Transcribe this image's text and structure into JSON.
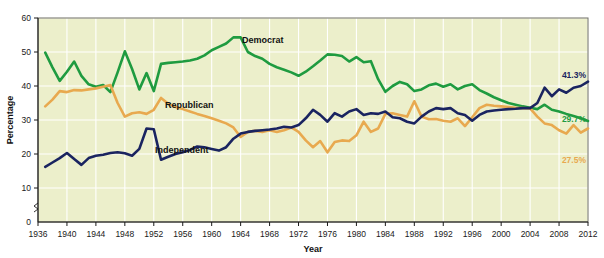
{
  "chart_data": {
    "type": "line",
    "title": "",
    "xlabel": "Year",
    "ylabel": "Percentage",
    "xlim": [
      1936,
      2012
    ],
    "ylim": [
      0,
      60
    ],
    "y_axis_break": true,
    "grid": true,
    "legend_position": "inline-labels",
    "background_color": "#ecefcb",
    "x_tick_labels": [
      "1936",
      "1940",
      "1944",
      "1948",
      "1952",
      "1956",
      "1960",
      "1964",
      "1968",
      "1972",
      "1976",
      "1980",
      "1984",
      "1988",
      "1992",
      "1996",
      "2000",
      "2004",
      "2008",
      "2012"
    ],
    "y_tick_labels": [
      "0",
      "10",
      "20",
      "30",
      "40",
      "50",
      "60"
    ],
    "y_ticks": [
      0,
      10,
      20,
      30,
      40,
      50,
      60
    ],
    "series": [
      {
        "name": "Democrat",
        "color": "#1f9b40",
        "inline_label": "Democrat",
        "end_label": "29.7%",
        "end_value": 29.7,
        "x": [
          1937,
          1938,
          1939,
          1940,
          1941,
          1942,
          1943,
          1944,
          1945,
          1946,
          1947,
          1948,
          1949,
          1950,
          1951,
          1952,
          1953,
          1954,
          1955,
          1956,
          1957,
          1958,
          1959,
          1960,
          1961,
          1962,
          1963,
          1964,
          1965,
          1966,
          1967,
          1968,
          1969,
          1970,
          1971,
          1972,
          1973,
          1974,
          1975,
          1976,
          1977,
          1978,
          1979,
          1980,
          1981,
          1982,
          1983,
          1984,
          1985,
          1986,
          1987,
          1988,
          1989,
          1990,
          1991,
          1992,
          1993,
          1994,
          1995,
          1996,
          1997,
          1998,
          1999,
          2000,
          2001,
          2002,
          2003,
          2004,
          2005,
          2006,
          2007,
          2008,
          2009,
          2010,
          2011,
          2012
        ],
        "values": [
          49.8,
          45.5,
          41.5,
          44.2,
          47.2,
          43.0,
          40.5,
          39.8,
          40.3,
          38.2,
          44.0,
          50.2,
          45.0,
          39.0,
          43.8,
          38.5,
          46.5,
          46.8,
          47.0,
          47.2,
          47.5,
          48.0,
          49.0,
          50.5,
          51.5,
          52.5,
          54.3,
          54.3,
          50.0,
          48.8,
          48.0,
          46.5,
          45.5,
          44.8,
          44.0,
          43.0,
          44.2,
          45.8,
          47.5,
          49.3,
          49.2,
          48.8,
          47.2,
          48.5,
          47.0,
          47.3,
          42.0,
          38.3,
          40.0,
          41.2,
          40.5,
          38.5,
          39.0,
          40.2,
          40.7,
          39.8,
          40.5,
          39.0,
          40.0,
          40.5,
          38.8,
          37.8,
          36.7,
          35.8,
          35.0,
          34.5,
          34.0,
          33.6,
          33.2,
          34.5,
          33.0,
          32.5,
          31.8,
          31.2,
          30.5,
          29.7
        ]
      },
      {
        "name": "Republican",
        "color": "#e8a94f",
        "inline_label": "Republican",
        "end_label": "27.5%",
        "end_value": 27.5,
        "x": [
          1937,
          1938,
          1939,
          1940,
          1941,
          1942,
          1943,
          1944,
          1945,
          1946,
          1947,
          1948,
          1949,
          1950,
          1951,
          1952,
          1953,
          1954,
          1955,
          1956,
          1957,
          1958,
          1959,
          1960,
          1961,
          1962,
          1963,
          1964,
          1965,
          1966,
          1967,
          1968,
          1969,
          1970,
          1971,
          1972,
          1973,
          1974,
          1975,
          1976,
          1977,
          1978,
          1979,
          1980,
          1981,
          1982,
          1983,
          1984,
          1985,
          1986,
          1987,
          1988,
          1989,
          1990,
          1991,
          1992,
          1993,
          1994,
          1995,
          1996,
          1997,
          1998,
          1999,
          2000,
          2001,
          2002,
          2003,
          2004,
          2005,
          2006,
          2007,
          2008,
          2009,
          2010,
          2011,
          2012
        ],
        "values": [
          34.0,
          36.0,
          38.5,
          38.2,
          38.8,
          38.7,
          39.0,
          39.3,
          39.8,
          40.3,
          35.0,
          31.0,
          32.0,
          32.3,
          31.8,
          33.0,
          36.5,
          34.8,
          33.8,
          33.2,
          32.5,
          31.8,
          31.2,
          30.5,
          29.8,
          29.0,
          27.8,
          25.0,
          26.5,
          26.8,
          26.5,
          27.0,
          26.5,
          27.0,
          27.8,
          26.5,
          24.0,
          22.0,
          23.8,
          20.5,
          23.5,
          24.0,
          23.8,
          25.5,
          29.5,
          26.5,
          27.5,
          31.8,
          32.0,
          31.5,
          31.0,
          35.5,
          31.0,
          30.2,
          30.3,
          29.8,
          29.5,
          30.5,
          28.2,
          30.8,
          33.5,
          34.5,
          34.2,
          34.0,
          33.8,
          33.6,
          33.5,
          33.4,
          31.0,
          29.0,
          28.5,
          27.0,
          26.0,
          28.5,
          26.3,
          27.5
        ]
      },
      {
        "name": "Independent",
        "color": "#1a2460",
        "inline_label": "Independent",
        "end_label": "41.3%",
        "end_value": 41.3,
        "x": [
          1937,
          1938,
          1939,
          1940,
          1941,
          1942,
          1943,
          1944,
          1945,
          1946,
          1947,
          1948,
          1949,
          1950,
          1951,
          1952,
          1953,
          1954,
          1955,
          1956,
          1957,
          1958,
          1959,
          1960,
          1961,
          1962,
          1963,
          1964,
          1965,
          1966,
          1967,
          1968,
          1969,
          1970,
          1971,
          1972,
          1973,
          1974,
          1975,
          1976,
          1977,
          1978,
          1979,
          1980,
          1981,
          1982,
          1983,
          1984,
          1985,
          1986,
          1987,
          1988,
          1989,
          1990,
          1991,
          1992,
          1993,
          1994,
          1995,
          1996,
          1997,
          1998,
          1999,
          2000,
          2001,
          2002,
          2003,
          2004,
          2005,
          2006,
          2007,
          2008,
          2009,
          2010,
          2011,
          2012
        ],
        "values": [
          16.2,
          17.5,
          18.8,
          20.3,
          18.5,
          16.8,
          18.8,
          19.5,
          19.8,
          20.3,
          20.5,
          20.2,
          19.5,
          21.5,
          27.5,
          27.3,
          18.3,
          19.2,
          20.0,
          20.5,
          21.2,
          22.2,
          22.0,
          21.5,
          21.0,
          22.0,
          24.5,
          26.0,
          26.5,
          26.8,
          27.0,
          27.2,
          27.5,
          28.0,
          27.8,
          28.5,
          30.5,
          33.0,
          31.5,
          29.5,
          32.0,
          31.0,
          32.5,
          33.2,
          31.5,
          32.0,
          31.8,
          32.5,
          30.8,
          30.5,
          29.5,
          29.0,
          31.0,
          32.5,
          33.5,
          33.2,
          33.5,
          32.0,
          31.5,
          29.8,
          31.5,
          32.5,
          32.8,
          33.0,
          33.2,
          33.3,
          33.5,
          33.5,
          35.0,
          39.5,
          37.0,
          39.0,
          38.0,
          39.5,
          40.0,
          41.3
        ]
      }
    ]
  }
}
